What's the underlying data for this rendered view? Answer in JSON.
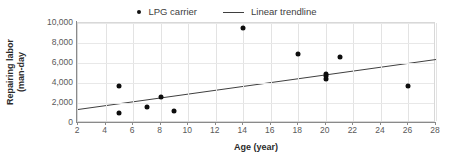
{
  "chart_data": {
    "type": "scatter",
    "title": "",
    "xlabel": "Age (year)",
    "ylabel": "Repairing labor (man-day",
    "ylabel_lines": [
      "Repairing labor",
      "(man-day"
    ],
    "xlim": [
      2,
      28
    ],
    "ylim": [
      0,
      10000
    ],
    "xticks": [
      2,
      4,
      6,
      8,
      10,
      12,
      14,
      16,
      18,
      20,
      22,
      24,
      26,
      28
    ],
    "xticklabels": [
      "2",
      "4",
      "6",
      "8",
      "10",
      "12",
      "14",
      "16",
      "18",
      "20",
      "22",
      "24",
      "26",
      "28"
    ],
    "yticks": [
      0,
      2000,
      4000,
      6000,
      8000,
      10000
    ],
    "yticklabels": [
      "0",
      "2,000",
      "4,000",
      "6,000",
      "8,000",
      "10,000"
    ],
    "grid": true,
    "legend_position": "top-center",
    "series": [
      {
        "name": "LPG carrier",
        "type": "scatter",
        "marker": "circle",
        "color": "#0d0d0d",
        "points": [
          {
            "x": 5,
            "y": 3700
          },
          {
            "x": 5,
            "y": 1050
          },
          {
            "x": 7,
            "y": 1650
          },
          {
            "x": 8,
            "y": 2650
          },
          {
            "x": 9,
            "y": 1200
          },
          {
            "x": 14,
            "y": 9550
          },
          {
            "x": 18,
            "y": 6900
          },
          {
            "x": 20,
            "y": 4400
          },
          {
            "x": 20,
            "y": 4750
          },
          {
            "x": 20,
            "y": 4900
          },
          {
            "x": 21,
            "y": 6650
          },
          {
            "x": 26,
            "y": 3700
          }
        ]
      },
      {
        "name": "Linear trendline",
        "type": "line",
        "color": "#3f3f3f",
        "points": [
          {
            "x": 2,
            "y": 1350
          },
          {
            "x": 28,
            "y": 6350
          }
        ]
      }
    ]
  },
  "legend": {
    "entries": [
      {
        "label": "LPG carrier",
        "marker": "scatter-dot-marker"
      },
      {
        "label": "Linear trendline",
        "marker": "trendline-segment-marker"
      }
    ]
  }
}
